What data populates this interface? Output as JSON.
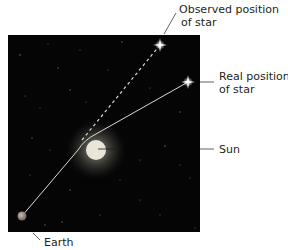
{
  "diagram": {
    "labels": {
      "observed_line1": "Observed position",
      "observed_line2": "of star",
      "real_line1": "Real position",
      "real_line2": "of star",
      "sun": "Sun",
      "earth": "Earth"
    },
    "colors": {
      "space": "#050505",
      "light_path": "#d8d8d8",
      "sun_core": "#e9e6d8",
      "sun_glow": "#8a8a80",
      "earth": "#9a8f88",
      "label_text": "#231f20",
      "leader_line": "#3a3a3a"
    }
  }
}
